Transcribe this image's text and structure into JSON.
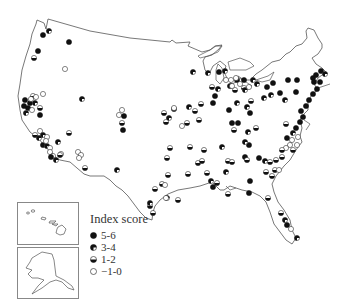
{
  "legend": {
    "title": "Index score",
    "items": [
      {
        "label": "5-6",
        "symbol": "full"
      },
      {
        "label": "3-4",
        "symbol": "three-quarter"
      },
      {
        "label": "1-2",
        "symbol": "half"
      },
      {
        "label": "−1-0",
        "symbol": "empty"
      }
    ]
  },
  "colors": {
    "outline": "#555555",
    "fill": "#111111",
    "background": "#ffffff"
  },
  "insets": [
    "Hawaii",
    "Alaska"
  ],
  "points": [
    [
      43,
      35,
      "full"
    ],
    [
      49,
      31,
      "tq"
    ],
    [
      69,
      42,
      "full"
    ],
    [
      38,
      51,
      "full"
    ],
    [
      34,
      58,
      "half"
    ],
    [
      65,
      69,
      "empty"
    ],
    [
      43,
      94,
      "empty"
    ],
    [
      33,
      96,
      "half"
    ],
    [
      25,
      100,
      "full"
    ],
    [
      30,
      103,
      "full"
    ],
    [
      35,
      103,
      "tq"
    ],
    [
      28,
      108,
      "full"
    ],
    [
      24,
      106,
      "full"
    ],
    [
      32,
      110,
      "empty"
    ],
    [
      26,
      113,
      "tq"
    ],
    [
      40,
      108,
      "half"
    ],
    [
      40,
      115,
      "full"
    ],
    [
      31,
      99,
      "empty"
    ],
    [
      36,
      97,
      "empty"
    ],
    [
      82,
      99,
      "tq"
    ],
    [
      122,
      110,
      "empty"
    ],
    [
      119,
      115,
      "empty"
    ],
    [
      124,
      116,
      "full"
    ],
    [
      122,
      123,
      "half"
    ],
    [
      123,
      130,
      "full"
    ],
    [
      40,
      131,
      "empty"
    ],
    [
      35,
      135,
      "half"
    ],
    [
      43,
      135,
      "tq"
    ],
    [
      39,
      138,
      "tq"
    ],
    [
      47,
      137,
      "empty"
    ],
    [
      43,
      145,
      "full"
    ],
    [
      47,
      146,
      "tq"
    ],
    [
      50,
      148,
      "empty"
    ],
    [
      46,
      141,
      "empty"
    ],
    [
      58,
      142,
      "tq"
    ],
    [
      50,
      152,
      "empty"
    ],
    [
      53,
      156,
      "empty"
    ],
    [
      61,
      154,
      "empty"
    ],
    [
      56,
      160,
      "tq"
    ],
    [
      60,
      155,
      "half"
    ],
    [
      51,
      157,
      "full"
    ],
    [
      69,
      133,
      "half"
    ],
    [
      78,
      152,
      "empty"
    ],
    [
      81,
      155,
      "empty"
    ],
    [
      79,
      158,
      "empty"
    ],
    [
      85,
      168,
      "half"
    ],
    [
      117,
      170,
      "tq"
    ],
    [
      164,
      113,
      "half"
    ],
    [
      174,
      109,
      "full"
    ],
    [
      169,
      118,
      "tq"
    ],
    [
      166,
      122,
      "half"
    ],
    [
      189,
      107,
      "tq"
    ],
    [
      187,
      123,
      "half"
    ],
    [
      195,
      111,
      "half"
    ],
    [
      201,
      104,
      "half"
    ],
    [
      213,
      103,
      "full"
    ],
    [
      215,
      96,
      "full"
    ],
    [
      208,
      73,
      "tq"
    ],
    [
      193,
      72,
      "tq"
    ],
    [
      174,
      108,
      "empty"
    ],
    [
      182,
      126,
      "empty"
    ],
    [
      199,
      120,
      "half"
    ],
    [
      170,
      148,
      "half"
    ],
    [
      190,
      147,
      "half"
    ],
    [
      204,
      150,
      "half"
    ],
    [
      222,
      147,
      "tq"
    ],
    [
      168,
      175,
      "half"
    ],
    [
      207,
      173,
      "half"
    ],
    [
      219,
      72,
      "full"
    ],
    [
      225,
      71,
      "tq"
    ],
    [
      212,
      87,
      "half"
    ],
    [
      218,
      89,
      "tq"
    ],
    [
      230,
      86,
      "full"
    ],
    [
      226,
      80,
      "empty"
    ],
    [
      237,
      80,
      "full"
    ],
    [
      244,
      88,
      "half"
    ],
    [
      235,
      90,
      "half"
    ],
    [
      245,
      90,
      "tq"
    ],
    [
      257,
      84,
      "tq"
    ],
    [
      253,
      80,
      "tq"
    ],
    [
      237,
      103,
      "tq"
    ],
    [
      247,
      107,
      "tq"
    ],
    [
      251,
      101,
      "half"
    ],
    [
      229,
      110,
      "full"
    ],
    [
      232,
      123,
      "full"
    ],
    [
      248,
      132,
      "tq"
    ],
    [
      256,
      128,
      "half"
    ],
    [
      234,
      130,
      "half"
    ],
    [
      238,
      123,
      "full"
    ],
    [
      250,
      113,
      "full"
    ],
    [
      231,
      80,
      "empty"
    ],
    [
      236,
      78,
      "empty"
    ],
    [
      240,
      84,
      "empty"
    ],
    [
      244,
      80,
      "full"
    ],
    [
      249,
      87,
      "empty"
    ],
    [
      232,
      86,
      "empty"
    ],
    [
      267,
      87,
      "full"
    ],
    [
      273,
      83,
      "full"
    ],
    [
      280,
      93,
      "full"
    ],
    [
      264,
      98,
      "tq"
    ],
    [
      271,
      95,
      "tq"
    ],
    [
      288,
      80,
      "full"
    ],
    [
      285,
      100,
      "tq"
    ],
    [
      296,
      92,
      "full"
    ],
    [
      313,
      78,
      "full"
    ],
    [
      297,
      80,
      "full"
    ],
    [
      316,
      75,
      "full"
    ],
    [
      321,
      71,
      "full"
    ],
    [
      325,
      74,
      "tq"
    ],
    [
      314,
      82,
      "full"
    ],
    [
      320,
      82,
      "full"
    ],
    [
      317,
      89,
      "full"
    ],
    [
      313,
      94,
      "full"
    ],
    [
      309,
      100,
      "full"
    ],
    [
      306,
      106,
      "full"
    ],
    [
      301,
      111,
      "full"
    ],
    [
      303,
      117,
      "full"
    ],
    [
      300,
      122,
      "full"
    ],
    [
      296,
      128,
      "full"
    ],
    [
      293,
      133,
      "tq"
    ],
    [
      287,
      138,
      "full"
    ],
    [
      286,
      124,
      "half"
    ],
    [
      292,
      140,
      "empty"
    ],
    [
      298,
      137,
      "empty"
    ],
    [
      290,
      145,
      "empty"
    ],
    [
      286,
      148,
      "empty"
    ],
    [
      293,
      150,
      "half"
    ],
    [
      282,
      150,
      "half"
    ],
    [
      297,
      145,
      "empty"
    ],
    [
      282,
      157,
      "half"
    ],
    [
      276,
      160,
      "half"
    ],
    [
      270,
      162,
      "half"
    ],
    [
      265,
      161,
      "tq"
    ],
    [
      259,
      158,
      "full"
    ],
    [
      249,
      145,
      "full"
    ],
    [
      245,
      157,
      "full"
    ],
    [
      228,
      161,
      "half"
    ],
    [
      226,
      172,
      "tq"
    ],
    [
      232,
      162,
      "half"
    ],
    [
      245,
      142,
      "tq"
    ],
    [
      247,
      160,
      "half"
    ],
    [
      266,
      172,
      "half"
    ],
    [
      272,
      176,
      "half"
    ],
    [
      275,
      170,
      "half"
    ],
    [
      279,
      170,
      "empty"
    ],
    [
      250,
      181,
      "full"
    ],
    [
      249,
      193,
      "full"
    ],
    [
      268,
      198,
      "half"
    ],
    [
      281,
      213,
      "half"
    ],
    [
      285,
      220,
      "tq"
    ],
    [
      287,
      225,
      "full"
    ],
    [
      291,
      229,
      "empty"
    ],
    [
      297,
      238,
      "tq"
    ],
    [
      167,
      198,
      "tq"
    ],
    [
      166,
      198,
      "empty"
    ],
    [
      162,
      184,
      "half"
    ],
    [
      165,
      185,
      "empty"
    ],
    [
      178,
      200,
      "half"
    ],
    [
      188,
      174,
      "half"
    ],
    [
      198,
      163,
      "half"
    ],
    [
      217,
      183,
      "half"
    ],
    [
      211,
      181,
      "tq"
    ],
    [
      213,
      187,
      "full"
    ],
    [
      228,
      194,
      "half"
    ],
    [
      155,
      189,
      "half"
    ],
    [
      150,
      206,
      "half"
    ],
    [
      153,
      213,
      "half"
    ],
    [
      150,
      203,
      "tq"
    ],
    [
      167,
      158,
      "half"
    ],
    [
      202,
      161,
      "half"
    ]
  ]
}
